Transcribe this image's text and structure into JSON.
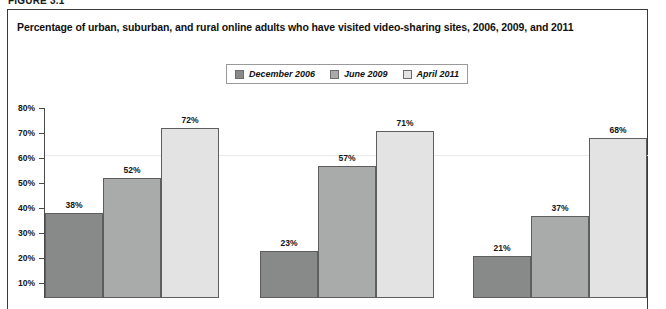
{
  "figure": {
    "label": "FIGURE 3.1",
    "title": "Percentage of urban, suburban, and rural online adults who have visited video-sharing sites, 2006, 2009, and 2011"
  },
  "legend": {
    "items": [
      {
        "label": "December 2006",
        "color": "#888a8a"
      },
      {
        "label": "June 2009",
        "color": "#a9aaaa"
      },
      {
        "label": "April 2011",
        "color": "#e3e3e3"
      }
    ]
  },
  "axis": {
    "y_ticks": [
      "80%",
      "70%",
      "60%",
      "50%",
      "40%",
      "30%",
      "20%",
      "10%"
    ]
  },
  "chart_data": {
    "type": "bar",
    "title": "Percentage of urban, suburban, and rural online adults who have visited video-sharing sites, 2006, 2009, and 2011",
    "xlabel": "",
    "ylabel": "",
    "ylim": [
      0,
      80
    ],
    "grid": true,
    "legend_position": "top-center",
    "categories": [
      "Urban",
      "Suburban",
      "Rural"
    ],
    "series": [
      {
        "name": "December 2006",
        "color": "#888a8a",
        "values": [
          38,
          52,
          72
        ]
      },
      {
        "name": "June 2009",
        "color": "#a9aaaa",
        "values": [
          23,
          57,
          71
        ]
      },
      {
        "name": "April 2011",
        "color": "#e3e3e3",
        "values": [
          21,
          37,
          68
        ]
      }
    ],
    "bars": [
      {
        "group": 0,
        "series": 0,
        "value": 38,
        "label": "38%"
      },
      {
        "group": 0,
        "series": 1,
        "value": 52,
        "label": "52%"
      },
      {
        "group": 0,
        "series": 2,
        "value": 72,
        "label": "72%"
      },
      {
        "group": 1,
        "series": 0,
        "value": 23,
        "label": "23%"
      },
      {
        "group": 1,
        "series": 1,
        "value": 57,
        "label": "57%"
      },
      {
        "group": 1,
        "series": 2,
        "value": 71,
        "label": "71%"
      },
      {
        "group": 2,
        "series": 0,
        "value": 21,
        "label": "21%"
      },
      {
        "group": 2,
        "series": 1,
        "value": 37,
        "label": "37%"
      },
      {
        "group": 2,
        "series": 2,
        "value": 68,
        "label": "68%"
      }
    ]
  }
}
